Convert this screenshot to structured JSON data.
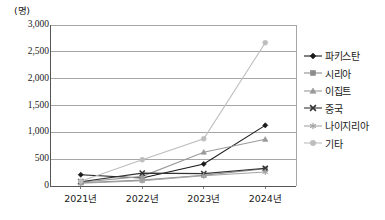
{
  "chart_data": {
    "type": "line",
    "title": "",
    "subtitle": "",
    "unit_label": "(명)",
    "xlabel": "",
    "ylabel": "",
    "categories": [
      "2021년",
      "2022년",
      "2023년",
      "2024년"
    ],
    "ylim": [
      0,
      3000
    ],
    "yticks": [
      "0",
      "500",
      "1,000",
      "1,500",
      "2,000",
      "2,500",
      "3,000"
    ],
    "ytick_values": [
      0,
      500,
      1000,
      1500,
      2000,
      2500,
      3000
    ],
    "grid": true,
    "legend_position": "right",
    "series": [
      {
        "name": "파키스탄",
        "values": [
          210,
          150,
          410,
          1130
        ],
        "color": "#1a1a1a",
        "marker": "diamond"
      },
      {
        "name": "시리아",
        "values": [
          60,
          110,
          200,
          320
        ],
        "color": "#8c8c8c",
        "marker": "square"
      },
      {
        "name": "이집트",
        "values": [
          70,
          180,
          630,
          870
        ],
        "color": "#9a9a9a",
        "marker": "triangle"
      },
      {
        "name": "중국",
        "values": [
          80,
          240,
          230,
          330
        ],
        "color": "#333333",
        "marker": "cross"
      },
      {
        "name": "나이지리아",
        "values": [
          50,
          100,
          190,
          260
        ],
        "color": "#a5a5a5",
        "marker": "asterisk"
      },
      {
        "name": "기타",
        "values": [
          90,
          490,
          880,
          2670
        ],
        "color": "#bdbdbd",
        "marker": "circle"
      }
    ]
  },
  "axis": {
    "unit": "(명)",
    "x_labels": [
      "2021년",
      "2022년",
      "2023년",
      "2024년"
    ],
    "y_labels": [
      "3,000",
      "2,500",
      "2,000",
      "1,500",
      "1,000",
      "500",
      "0"
    ]
  },
  "legend": {
    "items": [
      {
        "label": "파키스탄"
      },
      {
        "label": "시리아"
      },
      {
        "label": "이집트"
      },
      {
        "label": "중국"
      },
      {
        "label": "나이지리아"
      },
      {
        "label": "기타"
      }
    ]
  }
}
